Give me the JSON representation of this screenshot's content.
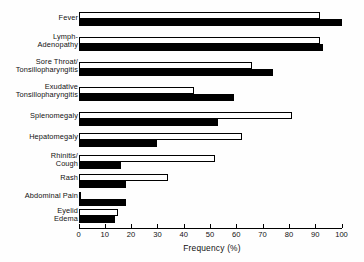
{
  "chart_data": {
    "type": "bar",
    "orientation": "horizontal",
    "title": "",
    "xlabel": "Frequency (%)",
    "ylabel": "",
    "xlim": [
      0,
      100
    ],
    "xticks": [
      0,
      10,
      20,
      30,
      40,
      50,
      60,
      70,
      80,
      90,
      100
    ],
    "xtick_labels": [
      "0",
      "10",
      "20",
      "30",
      "40",
      "50",
      "60",
      "70",
      "80",
      "90",
      "100"
    ],
    "grid": false,
    "legend": null,
    "categories": [
      "Fever",
      "Lymph-\nAdenopathy",
      "Sore Throat/\nTonsillopharyngitis",
      "Exudative\nTonsillopharyngitis",
      "Splenomegaly",
      "Hepatomegaly",
      "Rhinitis/\nCough",
      "Rash",
      "Abdominal Pain",
      "Eyelid\nEdema"
    ],
    "series": [
      {
        "name": "open",
        "style": "white-filled-outline",
        "values": [
          92,
          92,
          66,
          44,
          81,
          62,
          52,
          34,
          0,
          15
        ]
      },
      {
        "name": "solid",
        "style": "black-filled",
        "values": [
          100,
          93,
          74,
          59,
          53,
          30,
          16,
          18,
          18,
          14
        ]
      }
    ]
  },
  "axis": {
    "xlabel": "Frequency (%)"
  }
}
